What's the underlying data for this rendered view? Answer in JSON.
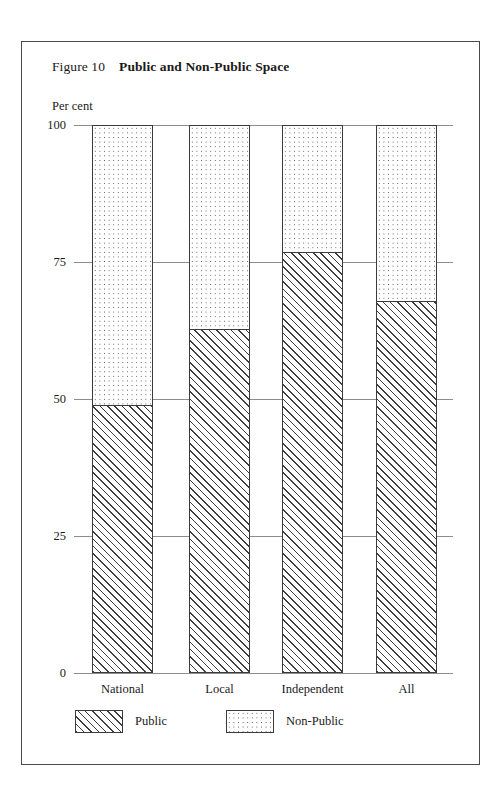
{
  "figure": {
    "label": "Figure 10",
    "title": "Public and Non-Public Space",
    "unit_label": "Per cent"
  },
  "chart_data": {
    "type": "bar",
    "subtype": "stacked-100-percent",
    "xlabel": "",
    "ylabel": "Per cent",
    "ylim": [
      0,
      100
    ],
    "yticks": [
      0,
      25,
      50,
      75,
      100
    ],
    "ytick_labels": [
      "0",
      "25",
      "50",
      "75",
      "100"
    ],
    "grid": true,
    "legend_position": "bottom-left",
    "categories": [
      "National",
      "Local",
      "Independent",
      "All"
    ],
    "series": [
      {
        "name": "Public",
        "pattern": "diagonal-hatch",
        "values": [
          49,
          63,
          77,
          68
        ]
      },
      {
        "name": "Non-Public",
        "pattern": "dotted",
        "values": [
          51,
          37,
          23,
          32
        ]
      }
    ]
  },
  "legend": {
    "entries": [
      {
        "label": "Public",
        "pattern": "diagonal-hatch"
      },
      {
        "label": "Non-Public",
        "pattern": "dotted"
      }
    ]
  },
  "colors": {
    "frame": "#4a4a4a",
    "gridline": "#8d8d8d",
    "bar_outline": "#3b3b3b",
    "hatch": "#3d3d3d",
    "dot": "#555555",
    "background": "#ffffff",
    "text": "#1a1a1a"
  }
}
